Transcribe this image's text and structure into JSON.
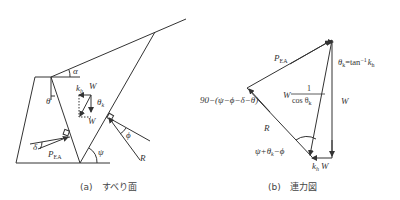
{
  "panel_a": {
    "caption": "(a)　すべり面",
    "labels": {
      "alpha": "α",
      "theta": "θ",
      "kh": "k",
      "kh_sub": "h",
      "W_top": "W",
      "theta_k": "θ",
      "theta_k_sub": "k",
      "W_bottom": "W",
      "delta": "δ",
      "P": "P",
      "P_sub": "EA",
      "psi": "ψ",
      "phi": "ϕ",
      "R": "R"
    }
  },
  "panel_b": {
    "caption": "(b)　連力図",
    "labels": {
      "P": "P",
      "P_sub": "EA",
      "theta_k_eq_main": "θ",
      "theta_k_eq_sub": "k",
      "theta_k_eq_rest": "=tan",
      "theta_k_eq_sup": "−1",
      "theta_k_eq_kh": "k",
      "theta_k_eq_kh_sub": "h",
      "W_frac_prefix": "W",
      "frac_num": "1",
      "frac_den": "cos θ",
      "frac_den_sub": "k",
      "W_right": "W",
      "angle_top": "90−(ψ−ϕ−δ−θ)",
      "R": "R",
      "angle_bottom": "ψ+θ",
      "angle_bottom_sub": "k",
      "angle_bottom_rest": "−ϕ",
      "khW_k": "k",
      "khW_sub": "h",
      "khW_W": "W"
    }
  }
}
